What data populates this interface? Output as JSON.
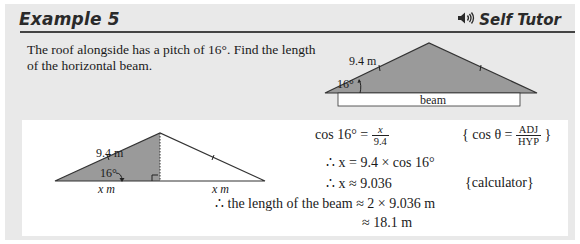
{
  "header": {
    "title": "Example 5",
    "tutor_label": "Self Tutor",
    "tutor_icon": "speaker-icon"
  },
  "question": {
    "text": "The roof alongside has a pitch of 16°.  Find the length of the horizontal beam."
  },
  "roof_diagram": {
    "side_label": "9.4 m",
    "angle_label": "16°",
    "beam_label": "beam"
  },
  "solution_diagram": {
    "hyp_label": "9.4 m",
    "angle_label": "16°",
    "left_base_label": "x m",
    "right_base_label": "x m"
  },
  "solution": {
    "line1_lhs": "cos 16° =",
    "line1_frac_num": "x",
    "line1_frac_den": "9.4",
    "line1_reason_pre": "{ cos θ =",
    "line1_reason_num": "ADJ",
    "line1_reason_den": "HYP",
    "line1_reason_post": "}",
    "line2": "∴  x = 9.4 × cos 16°",
    "line3": "∴  x ≈ 9.036",
    "line3_reason": "{calculator}",
    "line4": "∴  the length of the beam ≈ 2 × 9.036 m",
    "line5": "≈ 18.1 m"
  },
  "colors": {
    "panel_bg": "#e9e9e9",
    "roof_fill": "#9a9a9a",
    "rule": "#444444"
  }
}
